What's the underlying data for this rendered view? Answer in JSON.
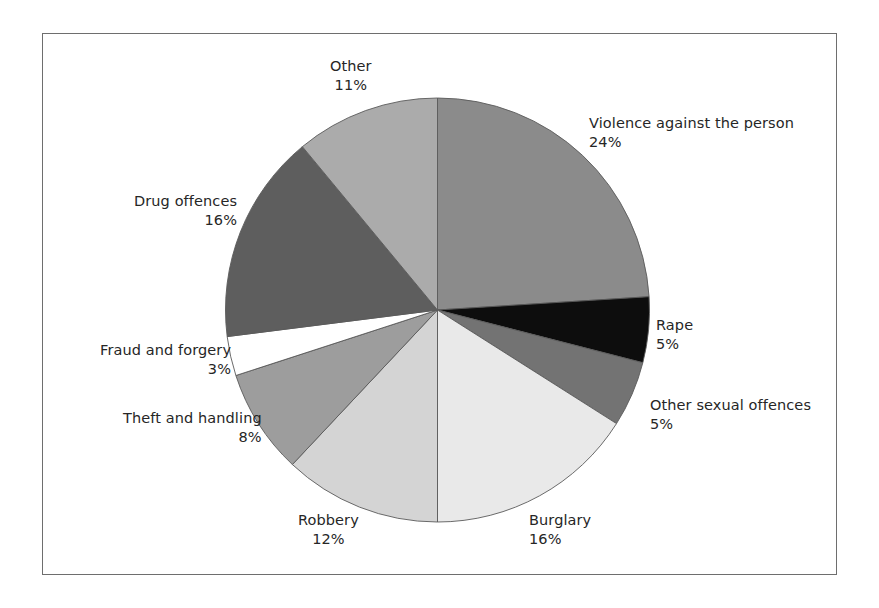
{
  "figure": {
    "border_color": "#6e6e6e",
    "background": "#ffffff"
  },
  "chart_data": {
    "type": "pie",
    "title": "",
    "subtitle": "",
    "xlabel": "",
    "ylabel": "",
    "legend_position": "none",
    "grid": false,
    "start_angle_deg": 0,
    "direction": "clockwise",
    "units": "%",
    "categories": [
      "Violence against the person",
      "Rape",
      "Other sexual offences",
      "Burglary",
      "Robbery",
      "Theft and handling",
      "Fraud and forgery",
      "Drug offences",
      "Other"
    ],
    "values": [
      24,
      5,
      5,
      16,
      12,
      8,
      3,
      16,
      11
    ],
    "value_labels": [
      "24%",
      "5%",
      "5%",
      "16%",
      "12%",
      "8%",
      "3%",
      "16%",
      "11%"
    ],
    "colors": [
      "#8b8b8b",
      "#0d0d0d",
      "#737373",
      "#e9e9e9",
      "#d4d4d4",
      "#9d9d9d",
      "#ffffff",
      "#5e5e5e",
      "#ababab"
    ],
    "slice_edge_color": "#5a5a5a",
    "slices": [
      {
        "label": "Violence against the person",
        "value": 24,
        "value_label": "24%",
        "color": "#8b8b8b"
      },
      {
        "label": "Rape",
        "value": 5,
        "value_label": "5%",
        "color": "#0d0d0d"
      },
      {
        "label": "Other sexual offences",
        "value": 5,
        "value_label": "5%",
        "color": "#737373"
      },
      {
        "label": "Burglary",
        "value": 16,
        "value_label": "16%",
        "color": "#e9e9e9"
      },
      {
        "label": "Robbery",
        "value": 12,
        "value_label": "12%",
        "color": "#d4d4d4"
      },
      {
        "label": "Theft and handling",
        "value": 8,
        "value_label": "8%",
        "color": "#9d9d9d"
      },
      {
        "label": "Fraud and forgery",
        "value": 3,
        "value_label": "3%",
        "color": "#ffffff"
      },
      {
        "label": "Drug offences",
        "value": 16,
        "value_label": "16%",
        "color": "#5e5e5e"
      },
      {
        "label": "Other",
        "value": 11,
        "value_label": "11%",
        "color": "#ababab"
      }
    ]
  },
  "labels": {
    "other": {
      "name": "Other",
      "pct": "11%"
    },
    "violence": {
      "name": "Violence against the person",
      "pct": "24%"
    },
    "rape": {
      "name": "Rape",
      "pct": "5%"
    },
    "othersexual": {
      "name": "Other sexual offences",
      "pct": "5%"
    },
    "burglary": {
      "name": "Burglary",
      "pct": "16%"
    },
    "robbery": {
      "name": "Robbery",
      "pct": "12%"
    },
    "theft": {
      "name": "Theft and handling",
      "pct": "8%"
    },
    "fraud": {
      "name": "Fraud and forgery",
      "pct": "3%"
    },
    "drug": {
      "name": "Drug offences",
      "pct": "16%"
    }
  }
}
